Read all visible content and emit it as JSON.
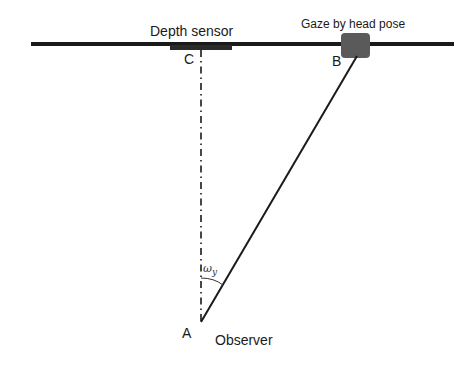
{
  "diagram": {
    "labels": {
      "depth_sensor": "Depth sensor",
      "gaze": "Gaze by head pose",
      "point_a": "A",
      "point_b": "B",
      "point_c": "C",
      "observer": "Observer",
      "angle_symbol": "ω",
      "angle_subscript": "y"
    },
    "colors": {
      "line": "#1a1a1a",
      "gaze_box": "#5a5a5a",
      "background": "#ffffff"
    },
    "geometry": {
      "screen_line": {
        "x1": 31,
        "y1": 44,
        "x2": 454,
        "y2": 44
      },
      "sensor_bar": {
        "x": 170,
        "y": 45,
        "width": 62,
        "height": 5
      },
      "gaze_box": {
        "x": 341,
        "y": 33,
        "width": 29,
        "height": 25
      },
      "point_a": {
        "x": 201,
        "y": 322
      },
      "point_b": {
        "x": 356,
        "y": 57
      },
      "point_c": {
        "x": 201,
        "y": 47
      }
    }
  }
}
